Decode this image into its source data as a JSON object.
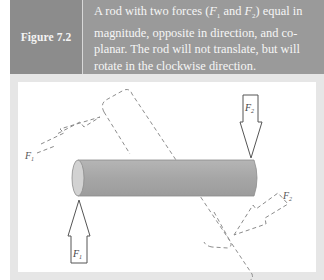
{
  "figure": {
    "label": "Figure 7.2",
    "caption": {
      "line1_pre": "A rod with two forces (",
      "f1": "F",
      "f1_sub": "1",
      "and": " and ",
      "f2": "F",
      "f2_sub": "2",
      "line1_post": ") equal in",
      "rest": "magnitude, opposite in direction, and co-planar. The rod will not translate, but will rotate in the clockwise direction."
    },
    "colors": {
      "header_bg": "#9a9a9a",
      "label_bg": "#8c8c8c",
      "frame_bg": "#e6e6e6",
      "rod_fill": "#a8a8a8",
      "dashed": "#8a8a8a"
    }
  },
  "diagram": {
    "rod": "horizontal cylinder",
    "force_labels": {
      "f1_solid": "F1",
      "f2_solid": "F2",
      "f1_dashed": "F1",
      "f2_dashed": "F2"
    }
  }
}
